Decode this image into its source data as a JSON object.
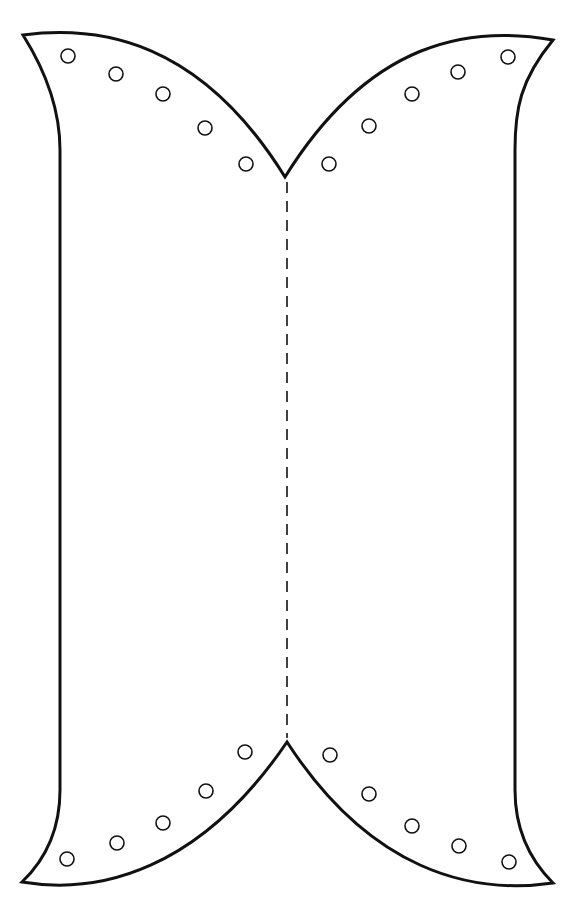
{
  "figure": {
    "type": "craft-pattern-template",
    "colors": {
      "stroke": "#111111",
      "background": "#ffffff"
    },
    "fold_line": {
      "style": "dashed",
      "x": 287,
      "y_start": 180,
      "y_end": 740
    },
    "holes": {
      "top_left": [
        [
          68,
          56
        ],
        [
          116,
          74
        ],
        [
          163,
          94
        ],
        [
          205,
          128
        ],
        [
          246,
          164
        ]
      ],
      "top_right": [
        [
          329,
          164
        ],
        [
          369,
          126
        ],
        [
          412,
          94
        ],
        [
          458,
          72
        ],
        [
          508,
          57
        ]
      ],
      "bottom_left": [
        [
          67,
          859
        ],
        [
          117,
          843
        ],
        [
          163,
          823
        ],
        [
          206,
          791
        ],
        [
          245,
          752
        ]
      ],
      "bottom_right": [
        [
          330,
          755
        ],
        [
          369,
          794
        ],
        [
          412,
          826
        ],
        [
          459,
          846
        ],
        [
          509,
          862
        ]
      ],
      "radius": 7
    }
  }
}
